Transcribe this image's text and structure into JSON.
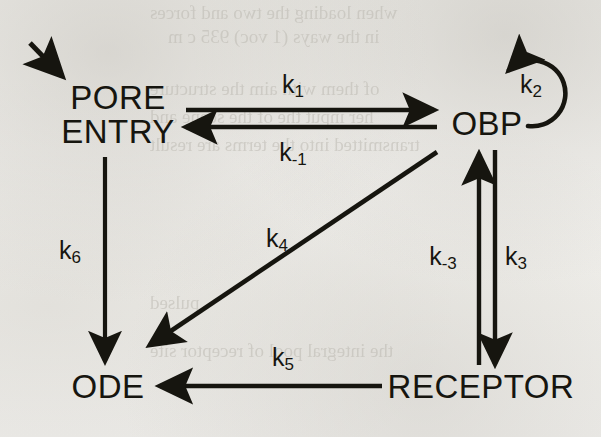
{
  "figure": {
    "type": "kinetic-scheme-diagram",
    "caption": "",
    "background_color": "#f2f1ee",
    "ink_color": "#16150f",
    "width": 601,
    "height": 437
  },
  "nodes": [
    {
      "id": "pore-entry",
      "label_line1": "PORE",
      "label_line2": "ENTRY",
      "label": "PORE ENTRY",
      "x": 118,
      "y": 115,
      "font_size": 33
    },
    {
      "id": "obp",
      "label_line1": "OBP",
      "label_line2": "",
      "label": "OBP",
      "x": 487,
      "y": 124,
      "font_size": 33
    },
    {
      "id": "ode",
      "label_line1": "ODE",
      "label_line2": "",
      "label": "ODE",
      "x": 108,
      "y": 387,
      "font_size": 33
    },
    {
      "id": "receptor",
      "label_line1": "RECEPTOR",
      "label_line2": "",
      "label": "RECEPTOR",
      "x": 481,
      "y": 387,
      "font_size": 33
    }
  ],
  "rate_constants": [
    {
      "id": "k1",
      "base": "k",
      "sub": "1",
      "label": "k1",
      "x": 293,
      "y": 84,
      "font_size": 25,
      "from": "pore-entry",
      "to": "obp"
    },
    {
      "id": "k-1",
      "base": "k",
      "sub": "-1",
      "label": "k-1",
      "x": 293,
      "y": 152,
      "font_size": 25,
      "from": "obp",
      "to": "pore-entry"
    },
    {
      "id": "k2",
      "base": "k",
      "sub": "2",
      "label": "k2",
      "x": 531,
      "y": 84,
      "font_size": 25,
      "from": "obp",
      "to": "obp"
    },
    {
      "id": "k3",
      "base": "k",
      "sub": "3",
      "label": "k3",
      "x": 516,
      "y": 256,
      "font_size": 25,
      "from": "obp",
      "to": "receptor"
    },
    {
      "id": "k-3",
      "base": "k",
      "sub": "-3",
      "label": "k-3",
      "x": 443,
      "y": 256,
      "font_size": 25,
      "from": "receptor",
      "to": "obp"
    },
    {
      "id": "k4",
      "base": "k",
      "sub": "4",
      "label": "k4",
      "x": 277,
      "y": 238,
      "font_size": 25,
      "from": "obp",
      "to": "ode"
    },
    {
      "id": "k5",
      "base": "k",
      "sub": "5",
      "label": "k5",
      "x": 283,
      "y": 357,
      "font_size": 25,
      "from": "receptor",
      "to": "ode"
    },
    {
      "id": "k6",
      "base": "k",
      "sub": "6",
      "label": "k6",
      "x": 70,
      "y": 250,
      "font_size": 25,
      "from": "pore-entry",
      "to": "ode"
    }
  ],
  "edges": [
    {
      "id": "inflow-arrow",
      "kind": "straight",
      "direction": "down-right",
      "label": null,
      "x1": 30,
      "y1": 43,
      "x2": 64,
      "y2": 78
    },
    {
      "id": "k1-arrow",
      "kind": "straight",
      "direction": "right",
      "label": "k1",
      "x1": 186,
      "y1": 110,
      "x2": 437,
      "y2": 110
    },
    {
      "id": "k-1-arrow",
      "kind": "straight",
      "direction": "left",
      "label": "k-1",
      "x1": 437,
      "y1": 127,
      "x2": 182,
      "y2": 127
    },
    {
      "id": "k2-selfloop",
      "kind": "arc",
      "direction": "clockwise",
      "label": "k2",
      "cx": 534,
      "cy": 93,
      "r": 33
    },
    {
      "id": "k-3-arrow",
      "kind": "straight",
      "direction": "up",
      "label": "k-3",
      "x1": 479,
      "y1": 363,
      "x2": 479,
      "y2": 152
    },
    {
      "id": "k3-arrow",
      "kind": "straight",
      "direction": "down",
      "label": "k3",
      "x1": 495,
      "y1": 150,
      "x2": 495,
      "y2": 367
    },
    {
      "id": "k4-arrow",
      "kind": "straight",
      "direction": "down-left",
      "label": "k4",
      "x1": 437,
      "y1": 152,
      "x2": 146,
      "y2": 348
    },
    {
      "id": "k5-arrow",
      "kind": "straight",
      "direction": "left",
      "label": "k5",
      "x1": 382,
      "y1": 386,
      "x2": 156,
      "y2": 386
    },
    {
      "id": "k6-arrow",
      "kind": "straight",
      "direction": "down",
      "label": "k6",
      "x1": 105,
      "y1": 157,
      "x2": 105,
      "y2": 364
    }
  ],
  "ghost_text": [
    {
      "text": "when loading the two and forces",
      "x": 150,
      "y": 2,
      "size": 19
    },
    {
      "text": "in the ways (1 voc) 935 c m",
      "x": 168,
      "y": 26,
      "size": 19
    },
    {
      "text": "of them with aim the structure",
      "x": 150,
      "y": 78,
      "size": 19
    },
    {
      "text": "her input the of the scene and",
      "x": 150,
      "y": 106,
      "size": 19
    },
    {
      "text": "transmitted into the terms are result",
      "x": 150,
      "y": 134,
      "size": 19
    },
    {
      "text": "pulsed",
      "x": 150,
      "y": 292,
      "size": 19
    },
    {
      "text": "the integral pool of receptor site",
      "x": 150,
      "y": 340,
      "size": 19
    }
  ]
}
